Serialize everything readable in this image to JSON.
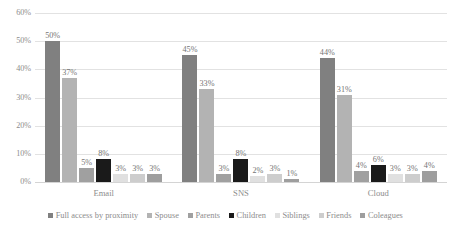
{
  "chart_data": {
    "type": "bar",
    "title": "",
    "subtitle": "",
    "xlabel": "",
    "ylabel": "",
    "categories": [
      "Email",
      "SNS",
      "Cloud"
    ],
    "ylim": [
      0,
      60
    ],
    "y_ticks": [
      "0%",
      "10%",
      "20%",
      "30%",
      "40%",
      "50%",
      "60%"
    ],
    "y_tick_values": [
      0,
      10,
      20,
      30,
      40,
      50,
      60
    ],
    "grid": true,
    "legend_position": "bottom",
    "value_suffix": "%",
    "series": [
      {
        "name": "Full access by proximity",
        "color": "#808080",
        "values": [
          50,
          45,
          44
        ],
        "labels": [
          "50%",
          "45%",
          "44%"
        ]
      },
      {
        "name": "Spouse",
        "color": "#b3b3b3",
        "values": [
          37,
          33,
          31
        ],
        "labels": [
          "37%",
          "33%",
          "31%"
        ]
      },
      {
        "name": "Parents",
        "color": "#a0a0a0",
        "values": [
          5,
          3,
          4
        ],
        "labels": [
          "5%",
          "3%",
          "4%"
        ]
      },
      {
        "name": "Children",
        "color": "#1a1a1a",
        "values": [
          8,
          8,
          6
        ],
        "labels": [
          "8%",
          "8%",
          "6%"
        ]
      },
      {
        "name": "Siblings",
        "color": "#e0e0e0",
        "values": [
          3,
          2,
          3
        ],
        "labels": [
          "3%",
          "2%",
          "3%"
        ]
      },
      {
        "name": "Friends",
        "color": "#cdcdcd",
        "values": [
          3,
          3,
          3
        ],
        "labels": [
          "3%",
          "3%",
          "3%"
        ]
      },
      {
        "name": "Coleagues",
        "color": "#9e9e9e",
        "values": [
          3,
          1,
          4
        ],
        "labels": [
          "3%",
          "1%",
          "4%"
        ]
      }
    ]
  },
  "colors": {
    "gridline": "#e2e2e2",
    "text": "#8c8c8c",
    "background": "#ffffff"
  }
}
